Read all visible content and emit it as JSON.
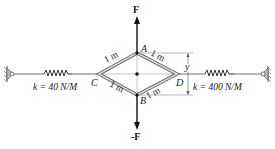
{
  "diagram": {
    "type": "rhombus linkage with springs",
    "points": {
      "A": "A",
      "B": "B",
      "C": "C",
      "D": "D"
    },
    "force_top": "F",
    "force_bottom": "-F",
    "member_length": "1 m",
    "dimension_label": "y",
    "left_spring": {
      "label": "k = 40 N/M"
    },
    "right_spring": {
      "label": "k = 400 N/M"
    },
    "colors": {
      "member_fill": "#cfcfcf",
      "member_edge": "#555555",
      "line": "#777777",
      "arrow": "#111111"
    }
  }
}
